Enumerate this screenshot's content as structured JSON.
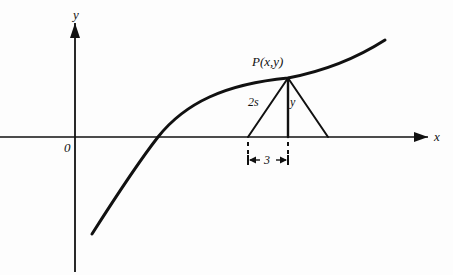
{
  "figure": {
    "background_color": "#fdfdfd",
    "ink_color": "#111111",
    "width": 453,
    "height": 275
  },
  "axes": {
    "x_label": "x",
    "y_label": "y",
    "origin_label": "0",
    "x_axis_y": 137,
    "y_axis_x": 75,
    "x_axis_start": 0,
    "x_axis_end": 428,
    "y_axis_top": 23,
    "y_axis_bottom": 272
  },
  "curve": {
    "name": "concave-down increasing curve",
    "path": "M 92,234 C 120,190 140,160 158,137 C 185,103 225,84 288,78 C 330,70 360,56 385,40",
    "x_intercept_px": 158,
    "stroke_width": 3
  },
  "triangle": {
    "apex_label": "P(x,y)",
    "apex": {
      "x": 288,
      "y": 78
    },
    "base_left": {
      "x": 248,
      "y": 137
    },
    "base_right": {
      "x": 328,
      "y": 137
    },
    "left_side_label": "2s",
    "height_label": "y",
    "stroke_width": 2
  },
  "dimension": {
    "label": "3",
    "left_tick_x": 248,
    "right_tick_x": 288,
    "line_y": 160,
    "tick_top_y": 142,
    "tick_bottom_y": 156
  },
  "labels": {
    "y_axis": {
      "text": "y",
      "x": 73,
      "y": 8
    },
    "x_axis": {
      "text": "x",
      "x": 434,
      "y": 130
    },
    "origin": {
      "text": "0",
      "x": 64,
      "y": 141
    },
    "point_p": {
      "text": "P(x,y)",
      "x": 252,
      "y": 55
    },
    "side_2s": {
      "text": "2s",
      "x": 248,
      "y": 96
    },
    "height_y": {
      "text": "y",
      "x": 290,
      "y": 96
    },
    "dim_3": {
      "text": "3",
      "x": 264,
      "y": 154
    }
  }
}
